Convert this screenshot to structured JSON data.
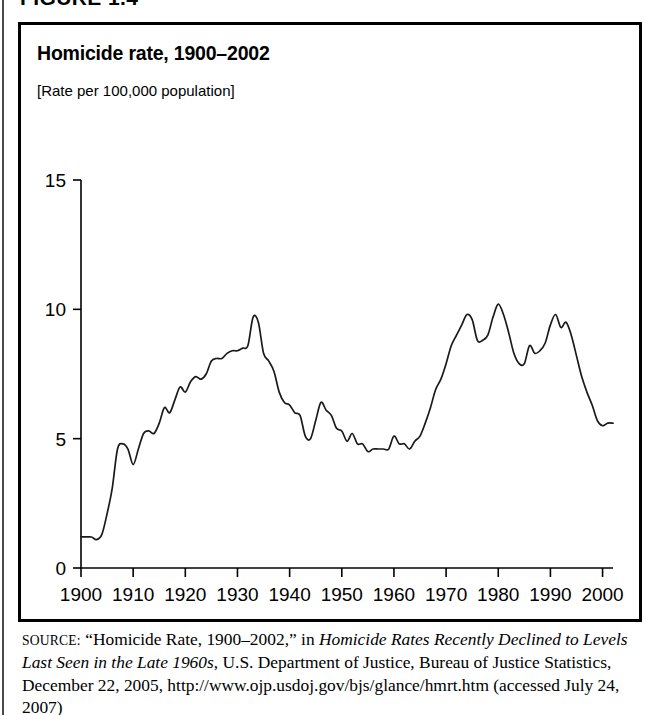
{
  "figure": {
    "label": "FIGURE 1.4",
    "title": "Homicide rate, 1900–2002",
    "subtitle": "[Rate per 100,000 population]"
  },
  "source": {
    "prefix": "SOURCE:",
    "quoted_title": "“Homicide Rate, 1900–2002,”",
    "connector": "in",
    "publication": "Homicide Rates Recently Declined to Levels Last Seen in the Late 1960s",
    "rest": ", U.S. Department of Justice, Bureau of Justice Statistics, December 22, 2005, http://www.ojp.usdoj.gov/bjs/glance/hmrt.htm (accessed July 24, 2007)"
  },
  "colors": {
    "line": "#1a1a1a",
    "axis": "#000000",
    "background": "#ffffff",
    "border": "#000000"
  },
  "chart_data": {
    "type": "line",
    "title": "Homicide rate, 1900–2002",
    "subtitle": "[Rate per 100,000 population]",
    "xlabel": "",
    "ylabel": "",
    "xlim": [
      1900,
      2002
    ],
    "ylim": [
      0,
      15
    ],
    "grid": false,
    "legend": null,
    "xticks": [
      1900,
      1910,
      1920,
      1930,
      1940,
      1950,
      1960,
      1970,
      1980,
      1990,
      2000
    ],
    "xtick_labels": [
      "1900",
      "1910",
      "1920",
      "1930",
      "1940",
      "1950",
      "1960",
      "1970",
      "1980",
      "1990",
      "2000"
    ],
    "yticks": [
      0,
      5,
      10,
      15
    ],
    "ytick_labels": [
      "0",
      "5",
      "10",
      "15"
    ],
    "series": [
      {
        "name": "Homicide rate per 100,000 population",
        "x": [
          1900,
          1901,
          1902,
          1903,
          1904,
          1905,
          1906,
          1907,
          1908,
          1909,
          1910,
          1911,
          1912,
          1913,
          1914,
          1915,
          1916,
          1917,
          1918,
          1919,
          1920,
          1921,
          1922,
          1923,
          1924,
          1925,
          1926,
          1927,
          1928,
          1929,
          1930,
          1931,
          1932,
          1933,
          1934,
          1935,
          1936,
          1937,
          1938,
          1939,
          1940,
          1941,
          1942,
          1943,
          1944,
          1945,
          1946,
          1947,
          1948,
          1949,
          1950,
          1951,
          1952,
          1953,
          1954,
          1955,
          1956,
          1957,
          1958,
          1959,
          1960,
          1961,
          1962,
          1963,
          1964,
          1965,
          1966,
          1967,
          1968,
          1969,
          1970,
          1971,
          1972,
          1973,
          1974,
          1975,
          1976,
          1977,
          1978,
          1979,
          1980,
          1981,
          1982,
          1983,
          1984,
          1985,
          1986,
          1987,
          1988,
          1989,
          1990,
          1991,
          1992,
          1993,
          1994,
          1995,
          1996,
          1997,
          1998,
          1999,
          2000,
          2001,
          2002
        ],
        "values": [
          1.2,
          1.2,
          1.2,
          1.1,
          1.3,
          2.1,
          3.1,
          4.6,
          4.8,
          4.6,
          4.0,
          4.6,
          5.2,
          5.3,
          5.2,
          5.6,
          6.2,
          6.0,
          6.5,
          7.0,
          6.8,
          7.2,
          7.4,
          7.3,
          7.5,
          8.0,
          8.1,
          8.1,
          8.3,
          8.4,
          8.4,
          8.5,
          8.6,
          9.7,
          9.5,
          8.3,
          8.0,
          7.6,
          6.8,
          6.4,
          6.3,
          6.0,
          5.9,
          5.1,
          5.0,
          5.7,
          6.4,
          6.1,
          5.9,
          5.4,
          5.3,
          4.9,
          5.2,
          4.8,
          4.8,
          4.5,
          4.6,
          4.6,
          4.6,
          4.6,
          5.1,
          4.8,
          4.8,
          4.6,
          4.9,
          5.1,
          5.6,
          6.2,
          6.9,
          7.3,
          7.9,
          8.6,
          9.0,
          9.4,
          9.8,
          9.6,
          8.8,
          8.8,
          9.0,
          9.7,
          10.2,
          9.8,
          9.1,
          8.3,
          7.9,
          7.9,
          8.6,
          8.3,
          8.4,
          8.7,
          9.4,
          9.8,
          9.3,
          9.5,
          9.0,
          8.2,
          7.4,
          6.8,
          6.3,
          5.7,
          5.5,
          5.6,
          5.6
        ]
      }
    ],
    "annotations": {
      "early_plateau": "Rate flat near 1.2 from 1900 to 1903",
      "prohibition_peak": "Peak 9.7 in 1933",
      "postwar_trough": "Low plateau near 4.6 through the 1950s",
      "modern_peaks": "Peaks near 9.8 in 1974, 10.2 in 1980 and 9.8 in 1991",
      "decline": "Decline to about 5.6 by 2002"
    }
  }
}
